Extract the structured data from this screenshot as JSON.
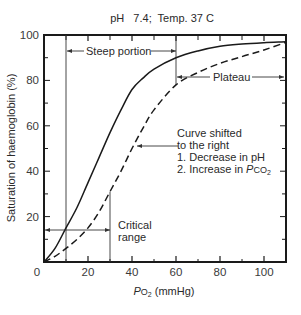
{
  "chart_data": {
    "type": "line",
    "title": "pH 7.4; Temp. 37 C",
    "xlabel": "PO2 (mmHg)",
    "xlabel_parts": {
      "italic": "P",
      "main": "O",
      "sub": "2",
      "rest": " (mmHg)"
    },
    "ylabel": "Saturation of haemoglobin (%)",
    "xlim": [
      0,
      110
    ],
    "ylim": [
      0,
      100
    ],
    "x_ticks": [
      0,
      20,
      40,
      60,
      80,
      100
    ],
    "x_tick_labels": [
      "0",
      "20",
      "40",
      "60",
      "80",
      "100"
    ],
    "x_minor_ticks": [
      10,
      30,
      50,
      70,
      90
    ],
    "y_ticks": [
      20,
      40,
      60,
      80,
      100
    ],
    "y_tick_labels": [
      "20",
      "40",
      "60",
      "80",
      "100"
    ],
    "y_minor_ticks": [
      10,
      30,
      50,
      70,
      90
    ],
    "grid": false,
    "series": [
      {
        "name": "Normal (pH 7.4)",
        "style": "solid",
        "x": [
          0,
          5,
          10,
          15,
          20,
          25,
          30,
          35,
          40,
          45,
          50,
          60,
          70,
          80,
          90,
          100,
          110
        ],
        "y": [
          0,
          6,
          15,
          24,
          35,
          46,
          57,
          67,
          76,
          81,
          85,
          90,
          93,
          95,
          96,
          96.6,
          97
        ]
      },
      {
        "name": "Curve shifted to the right",
        "style": "dashed",
        "x": [
          0,
          5,
          10,
          15,
          20,
          25,
          30,
          35,
          40,
          45,
          50,
          60,
          70,
          80,
          90,
          100,
          110
        ],
        "y": [
          0,
          2.5,
          6,
          10,
          15,
          22,
          31,
          40,
          50,
          59,
          67,
          78,
          83.5,
          87.5,
          90.5,
          93.4,
          96.8
        ]
      }
    ],
    "annotations": [
      {
        "text": "Steep portion",
        "type": "span-arrow",
        "x_from": 10,
        "x_to": 60,
        "y": 93
      },
      {
        "text": "Plateau",
        "type": "span-arrow",
        "x_from": 60,
        "x_to": 110,
        "y": 81.5
      },
      {
        "text": "Critical range",
        "type": "span-arrow",
        "x_from": 0,
        "x_to": 30,
        "y": 14
      },
      {
        "text_lines": [
          "Curve shifted",
          "to the right",
          "1. Decrease in pH",
          "2. Increase in PCO2"
        ],
        "type": "arrow",
        "arrow_to": [
          42,
          51
        ]
      }
    ],
    "reference_lines": [
      {
        "x": 10,
        "y_from": 0,
        "y_to": 100
      },
      {
        "x": 60,
        "y_from": 78,
        "y_to": 100
      },
      {
        "x": 30,
        "y_from": 0,
        "y_to": 31
      }
    ]
  },
  "labels": {
    "title": "pH   7.4;  Temp. 37 C",
    "steep": "Steep portion",
    "plateau": "Plateau",
    "critical_1": "Critical",
    "critical_2": "range",
    "shift_1": "Curve shifted",
    "shift_2": "to the right",
    "shift_3": "1. Decrease in pH",
    "shift_4_prefix": "2. Increase in ",
    "shift_4_italic": "P",
    "shift_4_main": "CO",
    "shift_4_sub": "2",
    "ylabel": "Saturation of haemoglobin (%)",
    "xlabel_italic": "P",
    "xlabel_main": "O",
    "xlabel_sub": "2",
    "xlabel_rest": " (mmHg)"
  },
  "colors": {
    "line": "#1a1a1a",
    "text": "#2a2a2a",
    "background": "#ffffff"
  }
}
